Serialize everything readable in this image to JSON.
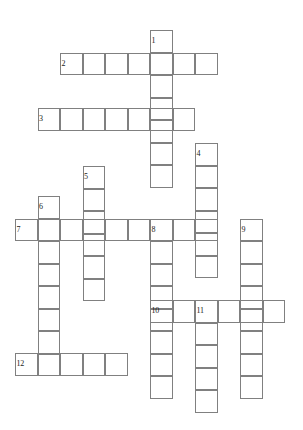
{
  "puzzle": {
    "title": "Crossword Puzzle Grid",
    "type": "crossword-grid",
    "canvas": {
      "width": 303,
      "height": 430,
      "background": "#ffffff"
    },
    "style": {
      "cell_size": 22.5,
      "line_color": "#808080",
      "line_width": 1,
      "number_color": "#1a1a1a",
      "number_font_size": 8
    },
    "grid_origin": {
      "x": 15,
      "y": 30
    },
    "entries": [
      {
        "number": "1",
        "label": "1",
        "direction": "down",
        "length": 7,
        "x": 150,
        "y": 30,
        "name": "entry-1-down"
      },
      {
        "number": "2",
        "label": "2",
        "direction": "across",
        "length": 7,
        "x": 60,
        "y": 52.5,
        "name": "entry-2-across"
      },
      {
        "number": "3",
        "label": "3",
        "direction": "across",
        "length": 7,
        "x": 37.5,
        "y": 108,
        "name": "entry-3-across"
      },
      {
        "number": "4",
        "label": "4",
        "direction": "down",
        "length": 6,
        "x": 195,
        "y": 143,
        "name": "entry-4-down"
      },
      {
        "number": "5",
        "label": "5",
        "direction": "down",
        "length": 6,
        "x": 82.5,
        "y": 166,
        "name": "entry-5-down"
      },
      {
        "number": "6",
        "label": "6",
        "direction": "down",
        "length": 8,
        "x": 37.5,
        "y": 196,
        "name": "entry-6-down"
      },
      {
        "number": "7",
        "label": "7",
        "direction": "across",
        "length": 9,
        "x": 15,
        "y": 218.5,
        "name": "entry-7-across"
      },
      {
        "number": "8",
        "label": "8",
        "direction": "down",
        "length": 8,
        "x": 150,
        "y": 218.5,
        "name": "entry-8-down"
      },
      {
        "number": "9",
        "label": "9",
        "direction": "down",
        "length": 8,
        "x": 240,
        "y": 218.5,
        "name": "entry-9-down"
      },
      {
        "number": "10",
        "label": "10",
        "direction": "across",
        "length": 6,
        "x": 150,
        "y": 300,
        "name": "entry-10-across"
      },
      {
        "number": "11",
        "label": "11",
        "direction": "down",
        "length": 5,
        "x": 195,
        "y": 300,
        "name": "entry-11-down"
      },
      {
        "number": "12",
        "label": "12",
        "direction": "across",
        "length": 5,
        "x": 15,
        "y": 353,
        "name": "entry-12-across"
      }
    ]
  }
}
